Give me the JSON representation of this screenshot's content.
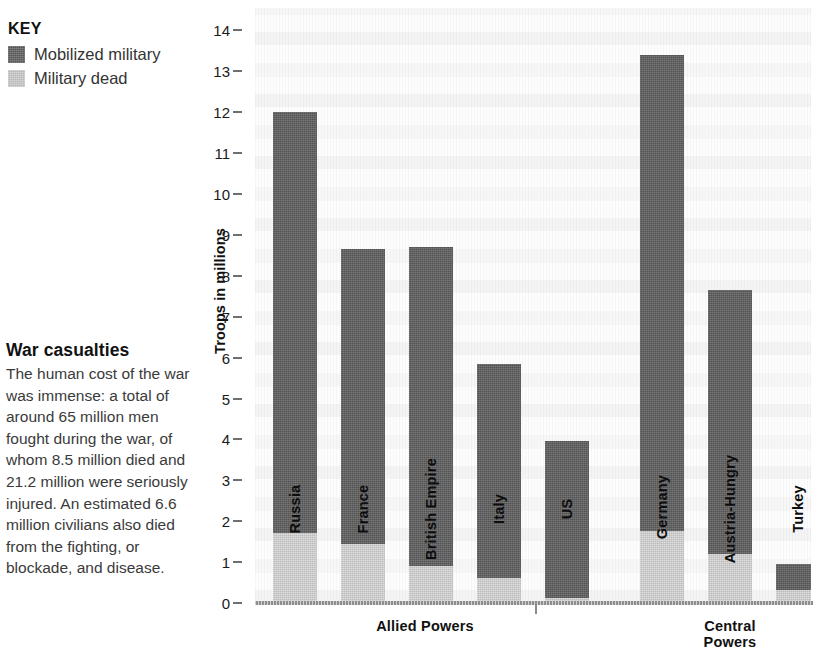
{
  "legend": {
    "title": "KEY",
    "items": [
      {
        "label": "Mobilized military",
        "color": "#5d5d5d",
        "key": "mobilized"
      },
      {
        "label": "Military dead",
        "color": "#c9c9c9",
        "key": "dead"
      }
    ]
  },
  "article": {
    "heading": "War casualties",
    "body": "The human cost of the war was immense: a total of around 65 million men fought during the war, of whom 8.5 million died and 21.2 million were seriously injured. An estimated 6.6 million civilians also died from the fighting, or blockade, and disease."
  },
  "chart_data": {
    "type": "bar",
    "subtype": "stacked-vertical-grouped",
    "title": "",
    "xlabel": "",
    "ylabel": "Troops in millions",
    "ylim": [
      0,
      14
    ],
    "ytick_step": 1,
    "yticks": [
      "0",
      "1",
      "2",
      "3",
      "4",
      "5",
      "6",
      "7",
      "8",
      "9",
      "10",
      "11",
      "12",
      "13",
      "14"
    ],
    "grid": false,
    "legend_position": "top-left-outside",
    "series": [
      {
        "name": "Mobilized military",
        "color": "#5d5d5d"
      },
      {
        "name": "Military dead",
        "color": "#c9c9c9"
      }
    ],
    "groups": [
      {
        "name": "Allied Powers",
        "bars": [
          {
            "category": "Russia",
            "mobilized": 12.0,
            "dead": 1.7
          },
          {
            "category": "France",
            "mobilized": 8.65,
            "dead": 1.45
          },
          {
            "category": "British Empire",
            "mobilized": 8.7,
            "dead": 0.9
          },
          {
            "category": "Italy",
            "mobilized": 5.85,
            "dead": 0.6
          },
          {
            "category": "US",
            "mobilized": 3.95,
            "dead": 0.12
          }
        ]
      },
      {
        "name": "Central Powers",
        "bars": [
          {
            "category": "Germany",
            "mobilized": 13.4,
            "dead": 1.77
          },
          {
            "category": "Austria-Hungry",
            "mobilized": 7.65,
            "dead": 1.2
          },
          {
            "category": "Turkey",
            "mobilized": 0.95,
            "dead": 0.33
          },
          {
            "category": "Bulgaria",
            "mobilized": 1.15,
            "dead": 0
          }
        ]
      }
    ]
  },
  "layout": {
    "bar_x": [
      18,
      86,
      154,
      222,
      290,
      385,
      453,
      521,
      589
    ],
    "bar_width": 44,
    "plot_height_px": 595,
    "baseline_px": 595,
    "px_per_unit": 40.9,
    "group_label_x": [
      170,
      475
    ]
  }
}
